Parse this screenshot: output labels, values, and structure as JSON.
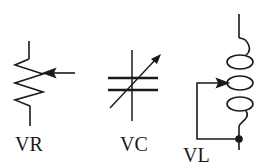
{
  "diagram": {
    "stroke_color": "#1a1a1a",
    "background": "#ffffff",
    "symbols": [
      {
        "id": "variable-resistor",
        "label": "VR",
        "type": "variable resistor (potentiometer)"
      },
      {
        "id": "variable-capacitor",
        "label": "VC",
        "type": "variable capacitor"
      },
      {
        "id": "variable-inductor",
        "label": "VL",
        "type": "variable inductor"
      }
    ]
  }
}
